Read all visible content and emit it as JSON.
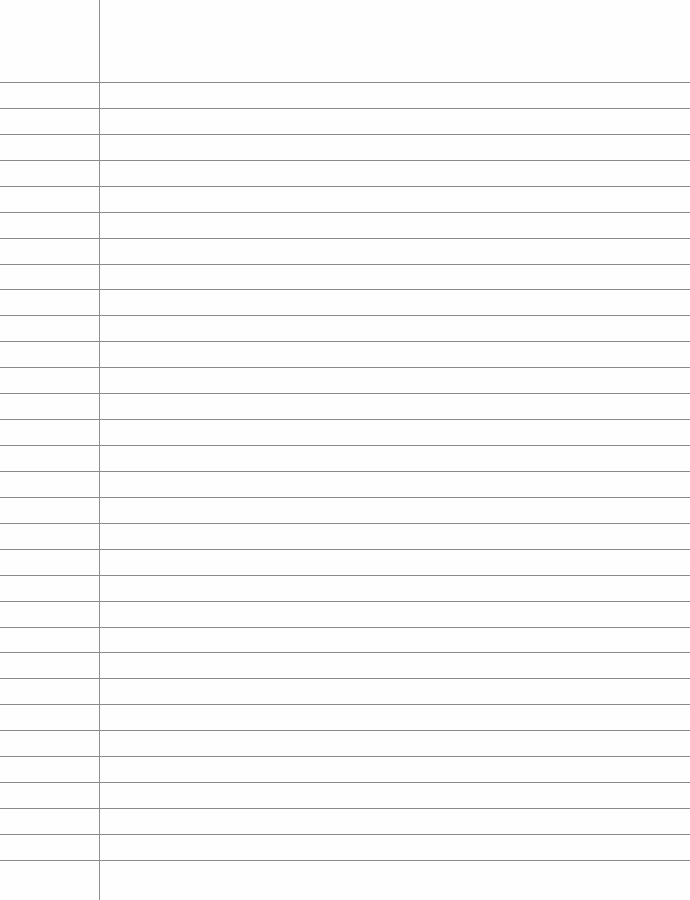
{
  "paper": {
    "type": "lined-notebook-page",
    "rule_count": 31,
    "first_rule_y": 82,
    "rule_spacing": 25.93,
    "margin_x": 99,
    "rule_color": "#8a8a8a",
    "margin_color": "#8f8f8f",
    "background": "#fefefe"
  }
}
